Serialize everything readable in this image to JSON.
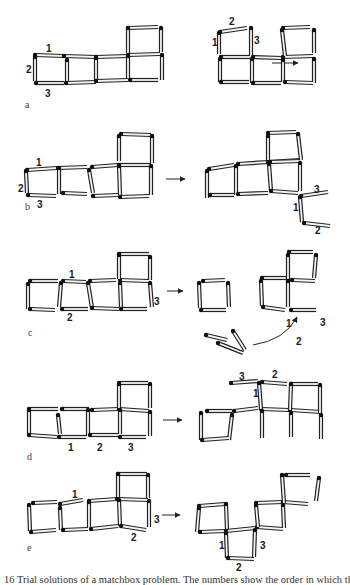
{
  "figure": {
    "caption": "16 Trial solutions of a matchbox problem. The numbers show the order in which the",
    "panels": [
      {
        "id": "a",
        "label": "a",
        "label_pos": [
          25,
          108
        ],
        "arrow": {
          "from": [
            272,
            63
          ],
          "to": [
            298,
            63
          ]
        },
        "sticks": [
          [
            35,
            55,
            64,
            56
          ],
          [
            64,
            56,
            96,
            57
          ],
          [
            96,
            57,
            128,
            56
          ],
          [
            128,
            55,
            160,
            54
          ],
          [
            128,
            28,
            158,
            27
          ],
          [
            35,
            57,
            35,
            81
          ],
          [
            67,
            60,
            67,
            82
          ],
          [
            96,
            58,
            96,
            81
          ],
          [
            128,
            28,
            128,
            53
          ],
          [
            161,
            28,
            161,
            52
          ],
          [
            128,
            56,
            128,
            80
          ],
          [
            162,
            55,
            162,
            80
          ],
          [
            36,
            83,
            64,
            83
          ],
          [
            66,
            83,
            96,
            82
          ],
          [
            96,
            81,
            128,
            80
          ],
          [
            130,
            80,
            158,
            80
          ]
        ],
        "numbers": [
          {
            "t": "1",
            "x": 46,
            "y": 52
          },
          {
            "t": "2",
            "x": 26,
            "y": 73
          },
          {
            "t": "3",
            "x": 45,
            "y": 97
          }
        ],
        "after_sticks": [
          [
            220,
            32,
            247,
            28
          ],
          [
            219,
            33,
            219,
            54
          ],
          [
            251,
            28,
            251,
            55
          ],
          [
            221,
            57,
            250,
            57
          ],
          [
            253,
            57,
            282,
            58
          ],
          [
            283,
            28,
            310,
            27
          ],
          [
            283,
            57,
            313,
            56
          ],
          [
            282,
            30,
            285,
            56
          ],
          [
            314,
            30,
            314,
            53
          ],
          [
            220,
            59,
            220,
            82
          ],
          [
            252,
            59,
            252,
            83
          ],
          [
            283,
            60,
            283,
            82
          ],
          [
            314,
            59,
            314,
            83
          ],
          [
            221,
            82,
            249,
            82
          ],
          [
            253,
            83,
            281,
            83
          ],
          [
            285,
            82,
            313,
            83
          ]
        ],
        "after_numbers": [
          {
            "t": "2",
            "x": 229,
            "y": 25
          },
          {
            "t": "1",
            "x": 212,
            "y": 46
          },
          {
            "t": "3",
            "x": 254,
            "y": 44
          }
        ]
      },
      {
        "id": "b",
        "label": "b",
        "label_pos": [
          25,
          210
        ],
        "arrow": {
          "from": [
            166,
            179
          ],
          "to": [
            185,
            179
          ]
        },
        "sticks": [
          [
            27,
            170,
            57,
            168
          ],
          [
            58,
            168,
            87,
            167
          ],
          [
            92,
            167,
            118,
            165
          ],
          [
            119,
            165,
            151,
            165
          ],
          [
            121,
            134,
            151,
            135
          ],
          [
            26,
            171,
            27,
            193
          ],
          [
            59,
            168,
            59,
            194
          ],
          [
            89,
            170,
            93,
            193
          ],
          [
            119,
            136,
            119,
            161
          ],
          [
            152,
            136,
            152,
            163
          ],
          [
            119,
            166,
            120,
            195
          ],
          [
            151,
            166,
            151,
            195
          ],
          [
            28,
            195,
            56,
            196
          ],
          [
            63,
            193,
            87,
            194
          ],
          [
            93,
            196,
            118,
            195
          ],
          [
            120,
            197,
            149,
            196
          ]
        ],
        "numbers": [
          {
            "t": "1",
            "x": 36,
            "y": 166
          },
          {
            "t": "2",
            "x": 18,
            "y": 192
          },
          {
            "t": "3",
            "x": 37,
            "y": 208
          }
        ],
        "after_sticks": [
          [
            209,
            169,
            234,
            165
          ],
          [
            238,
            164,
            268,
            162
          ],
          [
            268,
            162,
            300,
            160
          ],
          [
            268,
            133,
            296,
            132
          ],
          [
            270,
            162,
            301,
            161
          ],
          [
            207,
            171,
            207,
            198
          ],
          [
            236,
            166,
            236,
            195
          ],
          [
            268,
            136,
            268,
            160
          ],
          [
            298,
            134,
            301,
            160
          ],
          [
            269,
            164,
            271,
            191
          ],
          [
            300,
            163,
            300,
            191
          ],
          [
            210,
            195,
            234,
            195
          ],
          [
            238,
            194,
            268,
            193
          ],
          [
            271,
            191,
            298,
            193
          ],
          [
            301,
            196,
            328,
            192
          ],
          [
            300,
            197,
            302,
            222
          ],
          [
            304,
            223,
            330,
            226
          ]
        ],
        "after_numbers": [
          {
            "t": "3",
            "x": 314,
            "y": 193
          },
          {
            "t": "1",
            "x": 293,
            "y": 211
          },
          {
            "t": "2",
            "x": 315,
            "y": 234
          }
        ]
      },
      {
        "id": "c",
        "label": "c",
        "label_pos": [
          28,
          336
        ],
        "arrow": {
          "from": [
            167,
            291
          ],
          "to": [
            183,
            291
          ]
        },
        "sticks": [
          [
            30,
            281,
            58,
            281
          ],
          [
            63,
            281,
            86,
            282
          ],
          [
            90,
            281,
            116,
            280
          ],
          [
            120,
            280,
            148,
            281
          ],
          [
            119,
            254,
            149,
            254
          ],
          [
            28,
            284,
            28,
            309
          ],
          [
            61,
            283,
            59,
            307
          ],
          [
            88,
            283,
            92,
            308
          ],
          [
            119,
            255,
            119,
            279
          ],
          [
            150,
            257,
            150,
            280
          ],
          [
            120,
            283,
            121,
            307
          ],
          [
            150,
            283,
            152,
            307
          ],
          [
            30,
            309,
            55,
            310
          ],
          [
            62,
            309,
            88,
            309
          ],
          [
            92,
            308,
            119,
            309
          ],
          [
            121,
            309,
            147,
            309
          ]
        ],
        "numbers": [
          {
            "t": "1",
            "x": 69,
            "y": 278
          },
          {
            "t": "2",
            "x": 67,
            "y": 321
          },
          {
            "t": "3",
            "x": 154,
            "y": 305
          }
        ],
        "after_sticks": [
          [
            203,
            281,
            225,
            280
          ],
          [
            199,
            283,
            200,
            308
          ],
          [
            228,
            283,
            229,
            307
          ],
          [
            201,
            310,
            226,
            310
          ],
          [
            262,
            278,
            286,
            278
          ],
          [
            289,
            252,
            313,
            252
          ],
          [
            288,
            255,
            288,
            280
          ],
          [
            316,
            255,
            314,
            278
          ],
          [
            292,
            280,
            315,
            281
          ],
          [
            261,
            281,
            262,
            306
          ],
          [
            288,
            281,
            288,
            307
          ],
          [
            263,
            307,
            285,
            310
          ],
          [
            291,
            310,
            316,
            310
          ],
          [
            206,
            335,
            227,
            340
          ],
          [
            218,
            343,
            243,
            353
          ],
          [
            233,
            331,
            245,
            350
          ]
        ],
        "curve": {
          "d": "M 253 345 Q 285 340 297 317",
          "head": [
            297,
            317
          ]
        },
        "after_numbers": [
          {
            "t": "1",
            "x": 286,
            "y": 327
          },
          {
            "t": "3",
            "x": 320,
            "y": 326
          },
          {
            "t": "2",
            "x": 296,
            "y": 345
          }
        ]
      },
      {
        "id": "d",
        "label": "d",
        "label_pos": [
          27,
          460
        ],
        "arrow": {
          "from": [
            163,
            420
          ],
          "to": [
            182,
            420
          ]
        },
        "sticks": [
          [
            29,
            409,
            58,
            409
          ],
          [
            62,
            409,
            89,
            409
          ],
          [
            92,
            410,
            119,
            409
          ],
          [
            119,
            409,
            149,
            411
          ],
          [
            119,
            383,
            148,
            383
          ],
          [
            29,
            410,
            29,
            434
          ],
          [
            58,
            415,
            60,
            434
          ],
          [
            88,
            410,
            88,
            436
          ],
          [
            119,
            384,
            119,
            408
          ],
          [
            150,
            384,
            150,
            408
          ],
          [
            120,
            410,
            120,
            434
          ],
          [
            150,
            412,
            150,
            436
          ],
          [
            29,
            435,
            57,
            437
          ],
          [
            59,
            437,
            86,
            437
          ],
          [
            90,
            435,
            118,
            435
          ],
          [
            120,
            437,
            146,
            437
          ]
        ],
        "numbers": [
          {
            "t": "1",
            "x": 68,
            "y": 451
          },
          {
            "t": "2",
            "x": 97,
            "y": 451
          },
          {
            "t": "3",
            "x": 128,
            "y": 451
          }
        ],
        "after_sticks": [
          [
            207,
            411,
            232,
            411
          ],
          [
            234,
            411,
            258,
            408
          ],
          [
            261,
            409,
            289,
            410
          ],
          [
            290,
            410,
            321,
            412
          ],
          [
            231,
            383,
            258,
            381
          ],
          [
            262,
            382,
            287,
            384
          ],
          [
            291,
            384,
            318,
            384
          ],
          [
            201,
            413,
            201,
            440
          ],
          [
            232,
            415,
            229,
            440
          ],
          [
            259,
            383,
            261,
            409
          ],
          [
            291,
            384,
            290,
            410
          ],
          [
            320,
            385,
            320,
            413
          ],
          [
            262,
            411,
            262,
            438
          ],
          [
            291,
            413,
            291,
            437
          ],
          [
            321,
            415,
            321,
            439
          ],
          [
            202,
            440,
            229,
            438
          ]
        ],
        "after_numbers": [
          {
            "t": "3",
            "x": 239,
            "y": 380
          },
          {
            "t": "2",
            "x": 272,
            "y": 378
          },
          {
            "t": "1",
            "x": 253,
            "y": 397
          }
        ]
      },
      {
        "id": "e",
        "label": "e",
        "label_pos": [
          27,
          551
        ],
        "arrow": {
          "from": [
            162,
            515
          ],
          "to": [
            180,
            515
          ]
        },
        "sticks": [
          [
            33,
            503,
            57,
            502
          ],
          [
            60,
            504,
            83,
            500
          ],
          [
            89,
            501,
            117,
            499
          ],
          [
            117,
            499,
            148,
            500
          ],
          [
            118,
            474,
            147,
            474
          ],
          [
            29,
            505,
            30,
            531
          ],
          [
            60,
            508,
            61,
            530
          ],
          [
            89,
            502,
            89,
            528
          ],
          [
            118,
            474,
            118,
            497
          ],
          [
            148,
            475,
            148,
            498
          ],
          [
            119,
            500,
            120,
            526
          ],
          [
            149,
            501,
            149,
            527
          ],
          [
            31,
            532,
            56,
            530
          ],
          [
            63,
            530,
            88,
            529
          ],
          [
            91,
            529,
            118,
            526
          ],
          [
            121,
            526,
            146,
            530
          ]
        ],
        "numbers": [
          {
            "t": "1",
            "x": 72,
            "y": 498
          },
          {
            "t": "2",
            "x": 131,
            "y": 541
          },
          {
            "t": "3",
            "x": 154,
            "y": 523
          }
        ],
        "after_sticks": [
          [
            199,
            506,
            225,
            504
          ],
          [
            199,
            508,
            197,
            532
          ],
          [
            226,
            504,
            227,
            530
          ],
          [
            200,
            532,
            225,
            531
          ],
          [
            226,
            531,
            255,
            528
          ],
          [
            257,
            527,
            283,
            529
          ],
          [
            256,
            505,
            258,
            527
          ],
          [
            256,
            503,
            283,
            502
          ],
          [
            283,
            505,
            284,
            528
          ],
          [
            283,
            502,
            308,
            504
          ],
          [
            282,
            475,
            284,
            503
          ],
          [
            286,
            475,
            310,
            475
          ],
          [
            319,
            478,
            316,
            501
          ],
          [
            226,
            533,
            227,
            558
          ],
          [
            255,
            530,
            254,
            557
          ],
          [
            228,
            558,
            254,
            559
          ]
        ],
        "after_numbers": [
          {
            "t": "1",
            "x": 219,
            "y": 549
          },
          {
            "t": "2",
            "x": 236,
            "y": 571
          },
          {
            "t": "3",
            "x": 260,
            "y": 549
          }
        ]
      }
    ]
  }
}
